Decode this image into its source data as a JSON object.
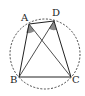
{
  "diagram": {
    "type": "geometry",
    "circle": {
      "cx": 45,
      "cy": 54,
      "r": 35,
      "style": "dashed"
    },
    "points": {
      "A": {
        "label": "A",
        "x": 29,
        "y": 24
      },
      "D": {
        "label": "D",
        "x": 54,
        "y": 21
      },
      "B": {
        "label": "B",
        "x": 19,
        "y": 77
      },
      "C": {
        "label": "C",
        "x": 71,
        "y": 77
      }
    },
    "segments": [
      "AD",
      "AB",
      "DC",
      "BC",
      "AC",
      "BD"
    ],
    "shaded_angles": [
      "BAC",
      "BDC"
    ],
    "colors": {
      "stroke": "#222222",
      "shade": "#888888",
      "background": "#ffffff"
    }
  }
}
